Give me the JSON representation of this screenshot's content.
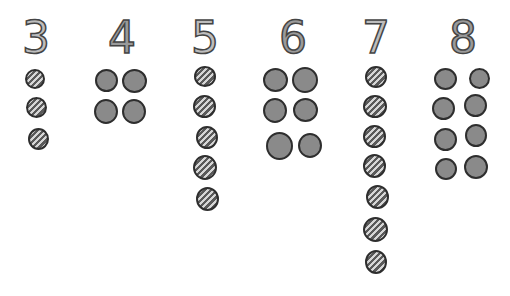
{
  "groups": [
    {
      "numeral": "3",
      "count": 3,
      "pattern": "striped",
      "layout": "single-column"
    },
    {
      "numeral": "4",
      "count": 4,
      "pattern": "solid",
      "layout": "two-columns"
    },
    {
      "numeral": "5",
      "count": 5,
      "pattern": "striped",
      "layout": "single-column"
    },
    {
      "numeral": "6",
      "count": 6,
      "pattern": "solid",
      "layout": "two-columns"
    },
    {
      "numeral": "7",
      "count": 7,
      "pattern": "striped",
      "layout": "single-column"
    },
    {
      "numeral": "8",
      "count": 8,
      "pattern": "solid",
      "layout": "two-columns"
    }
  ],
  "colors": {
    "background": "#ffffff",
    "dot_solid_fill": "#8a8a8a",
    "dot_outline": "#2e2e2e",
    "stripe_dark": "#5a5a5a",
    "stripe_light": "#d6d6d6",
    "numeral_fill": "#bdbdbd"
  }
}
